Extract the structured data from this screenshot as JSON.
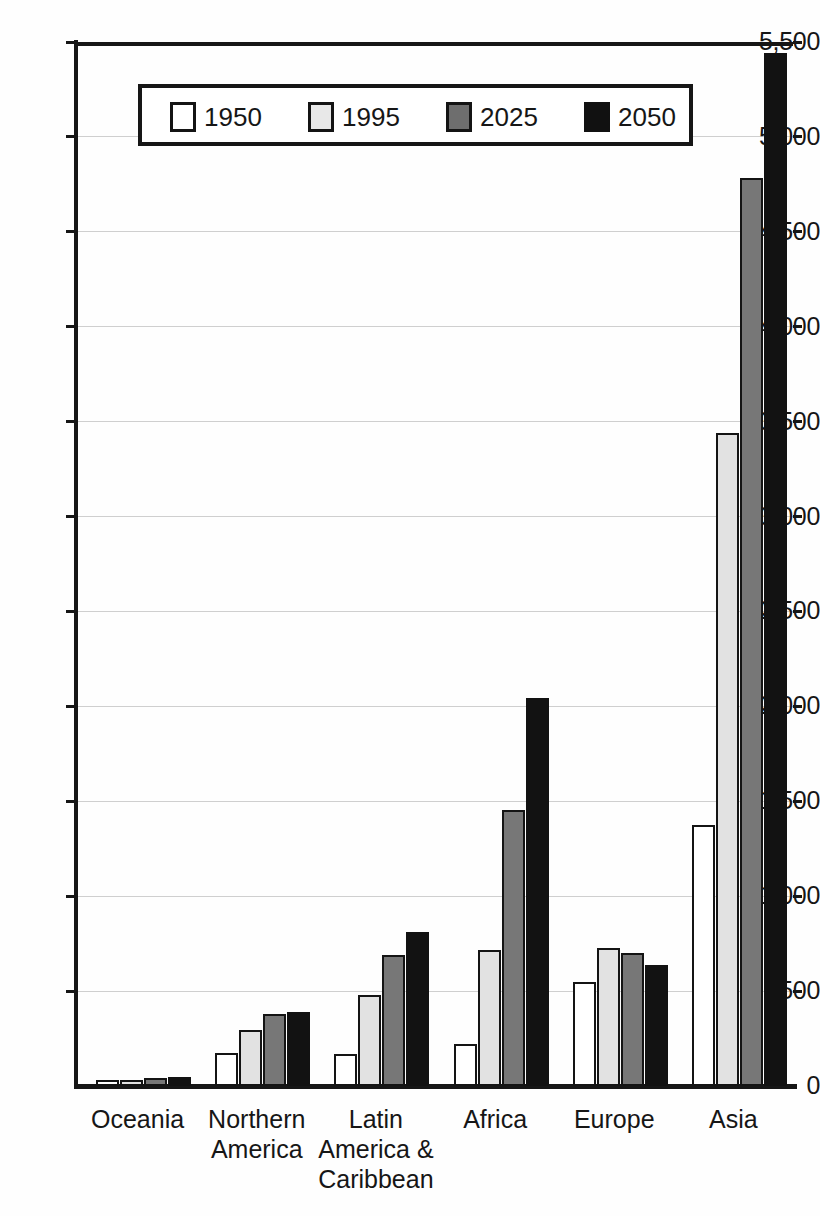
{
  "chart_data": {
    "type": "bar",
    "title": "",
    "subtitle": "",
    "xlabel": "",
    "ylabel": "",
    "ylim": [
      0,
      5500
    ],
    "ytick_step": 500,
    "grid": true,
    "legend_position": "top-center-inside",
    "categories": [
      "Oceania",
      "Northern\nAmerica",
      "Latin\nAmerica &\nCaribbean",
      "Africa",
      "Europe",
      "Asia"
    ],
    "ytick_labels": [
      "5,500",
      "5,000",
      "4,500",
      "4,000",
      "3,500",
      "3,000",
      "2,500",
      "2,000",
      "1,500",
      "1,000",
      "500",
      "0"
    ],
    "ytick_values": [
      5500,
      5000,
      4500,
      4000,
      3500,
      3000,
      2500,
      2000,
      1500,
      1000,
      500,
      0
    ],
    "series": [
      {
        "name": "1950",
        "color": "#ffffff",
        "values": [
          13,
          172,
          167,
          222,
          548,
          1377
        ]
      },
      {
        "name": "1995",
        "color": "#e2e2e2",
        "values": [
          28,
          297,
          477,
          719,
          727,
          3438
        ]
      },
      {
        "name": "2025",
        "color": "#777777",
        "values": [
          41,
          377,
          690,
          1453,
          701,
          4785
        ]
      },
      {
        "name": "2050",
        "color": "#121212",
        "values": [
          46,
          392,
          810,
          2046,
          638,
          5443
        ]
      }
    ]
  },
  "legend": {
    "items": [
      {
        "label": "1950"
      },
      {
        "label": "1995"
      },
      {
        "label": "2025"
      },
      {
        "label": "2050"
      }
    ]
  }
}
